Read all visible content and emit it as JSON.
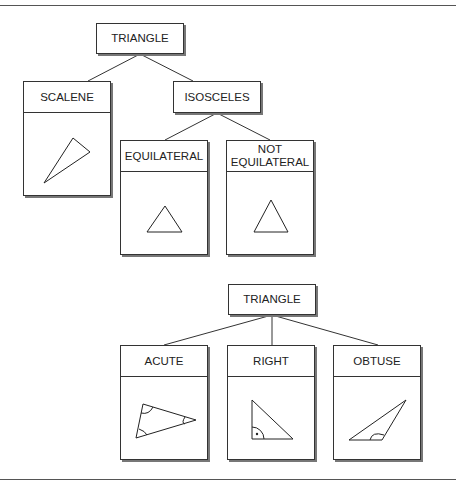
{
  "diagram_1": {
    "root": {
      "label": "TRIANGLE"
    },
    "scalene": {
      "label": "SCALENE",
      "shape": "scalene-triangle-icon"
    },
    "isosceles": {
      "label": "ISOSCELES"
    },
    "equilateral": {
      "label": "EQUILATERAL",
      "shape": "equilateral-triangle-icon"
    },
    "not_equilateral": {
      "label_line1": "NOT",
      "label_line2": "EQUILATERAL",
      "shape": "isosceles-triangle-icon"
    }
  },
  "diagram_2": {
    "root": {
      "label": "TRIANGLE"
    },
    "acute": {
      "label": "ACUTE",
      "shape": "acute-triangle-icon"
    },
    "right": {
      "label": "RIGHT",
      "shape": "right-triangle-icon"
    },
    "obtuse": {
      "label": "OBTUSE",
      "shape": "obtuse-triangle-icon"
    }
  },
  "colors": {
    "line": "#333333",
    "shadow": "#777777",
    "background": "#ffffff"
  }
}
